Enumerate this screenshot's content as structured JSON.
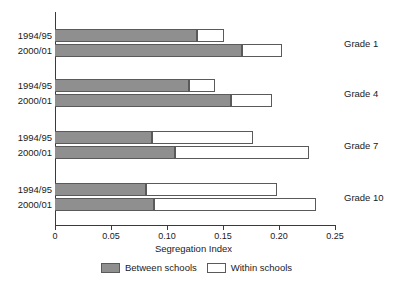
{
  "chart_data": {
    "type": "bar",
    "orientation": "horizontal",
    "stacked": true,
    "title": "",
    "xlabel": "Segregation Index",
    "ylabel": "",
    "xlim": [
      0,
      0.25
    ],
    "xticks": [
      "0",
      "0.05",
      "0.10",
      "0.15",
      "0.20",
      "0.25"
    ],
    "xtick_values": [
      0,
      0.05,
      0.1,
      0.15,
      0.2,
      0.25
    ],
    "grid": false,
    "legend_position": "bottom-center",
    "legend": [
      {
        "name": "Between schools",
        "color": "#8f8f8f"
      },
      {
        "name": "Within schools",
        "color": "#ffffff"
      }
    ],
    "groups": [
      {
        "label": "Grade 1",
        "rows": [
          {
            "label": "1994/95",
            "between": 0.127,
            "within": 0.024,
            "total": 0.151
          },
          {
            "label": "2000/01",
            "between": 0.167,
            "within": 0.036,
            "total": 0.203
          }
        ]
      },
      {
        "label": "Grade 4",
        "rows": [
          {
            "label": "1994/95",
            "between": 0.12,
            "within": 0.023,
            "total": 0.143
          },
          {
            "label": "2000/01",
            "between": 0.157,
            "within": 0.037,
            "total": 0.194
          }
        ]
      },
      {
        "label": "Grade 7",
        "rows": [
          {
            "label": "1994/95",
            "between": 0.087,
            "within": 0.09,
            "total": 0.177
          },
          {
            "label": "2000/01",
            "between": 0.107,
            "within": 0.12,
            "total": 0.227
          }
        ]
      },
      {
        "label": "Grade 10",
        "rows": [
          {
            "label": "1994/95",
            "between": 0.081,
            "within": 0.117,
            "total": 0.198
          },
          {
            "label": "2000/01",
            "between": 0.088,
            "within": 0.145,
            "total": 0.233
          }
        ]
      }
    ]
  },
  "colors": {
    "between": "#8f8f8f",
    "within": "#ffffff",
    "outline": "#5a5a5a",
    "axis": "#3a3a3a",
    "text": "#1a1a1a",
    "background": "#ffffff"
  }
}
